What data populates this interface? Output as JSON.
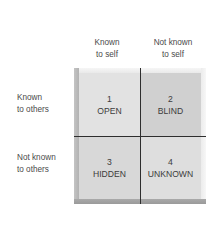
{
  "diagram": {
    "type": "johari-window",
    "columns": [
      {
        "line1": "Known",
        "line2": "to self"
      },
      {
        "line1": "Not known",
        "line2": "to self"
      }
    ],
    "rows": [
      {
        "line1": "Known",
        "line2": "to others"
      },
      {
        "line1": "Not known",
        "line2": "to others"
      }
    ],
    "quadrants": [
      {
        "number": "1",
        "label": "OPEN",
        "color": "#e2e2e2"
      },
      {
        "number": "2",
        "label": "BLIND",
        "color": "#d0d0d0"
      },
      {
        "number": "3",
        "label": "HIDDEN",
        "color": "#d8d8d8"
      },
      {
        "number": "4",
        "label": "UNKNOWN",
        "color": "#dedede"
      }
    ],
    "divider_color": "#2e2e2e"
  }
}
